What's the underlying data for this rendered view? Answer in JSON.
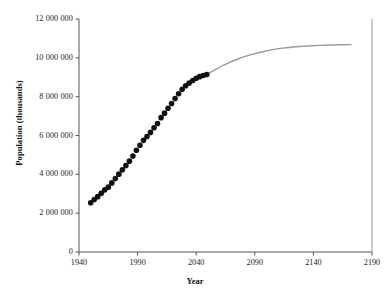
{
  "chart_data": {
    "type": "scatter",
    "title": "",
    "xlabel": "Year",
    "ylabel": "Population (thousands)",
    "xlim": [
      1940,
      2190
    ],
    "ylim": [
      0,
      12000000
    ],
    "grid": false,
    "legend": "none",
    "x_ticks": [
      "1940",
      "1990",
      "2040",
      "2090",
      "2140",
      "2190"
    ],
    "x_tick_values": [
      1940,
      1990,
      2040,
      2090,
      2140,
      2190
    ],
    "y_ticks": [
      "0",
      "2 000 000",
      "4 000 000",
      "6 000 000",
      "8 000 000",
      "10 000 000",
      "12 000 000"
    ],
    "y_tick_values": [
      0,
      2000000,
      4000000,
      6000000,
      8000000,
      10000000,
      12000000
    ],
    "series": [
      {
        "name": "Observed / estimated population",
        "style": "markers",
        "marker": "filled-circle",
        "color": "#111111",
        "marker_size": 5.6,
        "x": [
          1950,
          1953,
          1956,
          1959,
          1962,
          1965,
          1968,
          1971,
          1974,
          1977,
          1980,
          1983,
          1986,
          1989,
          1992,
          1995,
          1998,
          2001,
          2004,
          2007,
          2010,
          2013,
          2016,
          2019,
          2022,
          2025,
          2028,
          2031,
          2034,
          2037,
          2040,
          2043,
          2046,
          2049
        ],
        "y": [
          2536000,
          2700000,
          2850000,
          3020000,
          3200000,
          3340000,
          3560000,
          3780000,
          4010000,
          4230000,
          4450000,
          4680000,
          4940000,
          5240000,
          5500000,
          5750000,
          5950000,
          6160000,
          6400000,
          6620000,
          6920000,
          7150000,
          7400000,
          7650000,
          7900000,
          8150000,
          8380000,
          8560000,
          8700000,
          8830000,
          8950000,
          9030000,
          9090000,
          9140000
        ]
      },
      {
        "name": "Projected population (trend curve)",
        "style": "line",
        "color": "#9a9a9a",
        "line_width": 1.4,
        "x": [
          2049,
          2055,
          2062,
          2070,
          2078,
          2086,
          2095,
          2105,
          2115,
          2125,
          2135,
          2145,
          2155,
          2165,
          2172
        ],
        "y": [
          9140000,
          9350000,
          9580000,
          9810000,
          10000000,
          10150000,
          10290000,
          10420000,
          10510000,
          10570000,
          10610000,
          10640000,
          10660000,
          10670000,
          10680000
        ]
      }
    ]
  },
  "axes": {
    "x_axis_name": "year-axis",
    "y_axis_name": "population-axis",
    "right_spine": true
  }
}
